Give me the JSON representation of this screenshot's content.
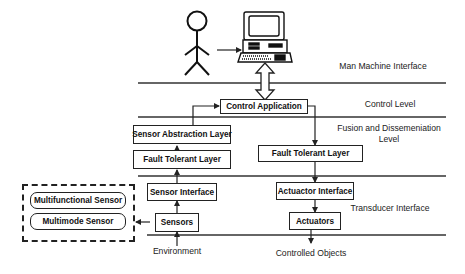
{
  "diagram": {
    "type": "layered architecture diagram",
    "layers": [
      {
        "id": "man_machine",
        "label": "Man Machine Interface"
      },
      {
        "id": "control",
        "label": "Control Level"
      },
      {
        "id": "fusion",
        "label_line1": "Fusion and Dissemeniation",
        "label_line2": "Level"
      },
      {
        "id": "transducer",
        "label": "Transducer Interface"
      }
    ],
    "nodes": {
      "control_application": "Control Application",
      "sensor_abstraction_layer": "Sensor Abstraction Layer",
      "fault_tolerant_layer_left": "Fault Tolerant Layer",
      "fault_tolerant_layer_right": "Fault Tolerant Layer",
      "sensor_interface": "Sensor Interface",
      "sensors": "Sensors",
      "actuator_interface": "Actuactor Interface",
      "actuators": "Actuators",
      "multifunctional_sensor": "Multifunctional Sensor",
      "multimode_sensor": "Multimode Sensor"
    },
    "external": {
      "environment": "Environment",
      "controlled_objects": "Controlled Objects"
    },
    "icons": {
      "user": "stick-figure-icon",
      "computer": "computer-terminal-icon"
    },
    "edges": [
      {
        "from": "user",
        "to": "computer"
      },
      {
        "from": "computer",
        "to": "control_application",
        "bidirectional": true
      },
      {
        "from": "sensor_abstraction_layer",
        "to": "control_application"
      },
      {
        "from": "fault_tolerant_layer_left",
        "to": "sensor_abstraction_layer"
      },
      {
        "from": "sensor_interface",
        "to": "fault_tolerant_layer_left"
      },
      {
        "from": "sensors",
        "to": "sensor_interface"
      },
      {
        "from": "environment",
        "to": "sensors"
      },
      {
        "from": "sensors",
        "to": "sensor_types_group"
      },
      {
        "from": "control_application",
        "to": "fault_tolerant_layer_right"
      },
      {
        "from": "fault_tolerant_layer_right",
        "to": "actuator_interface"
      },
      {
        "from": "actuator_interface",
        "to": "actuators"
      },
      {
        "from": "actuators",
        "to": "controlled_objects"
      }
    ],
    "colors": {
      "line": "#222222",
      "background": "#ffffff"
    }
  }
}
